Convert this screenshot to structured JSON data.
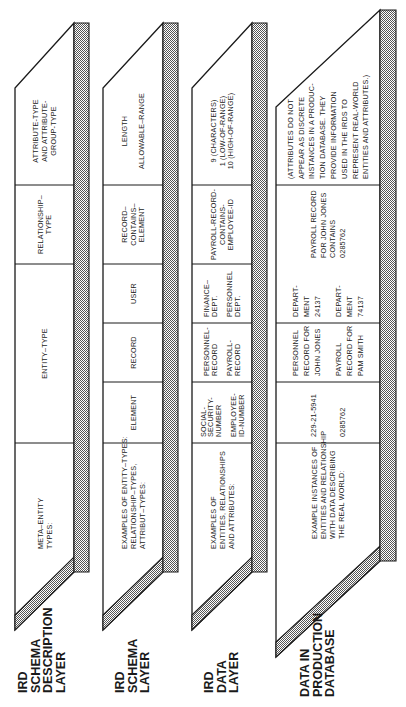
{
  "colors": {
    "ink": "#1a1a1a",
    "paper": "#ffffff",
    "shade": "#b9b9b9"
  },
  "layers": [
    {
      "name": [
        "IRD",
        "SCHEMA",
        "DESCRIPTION",
        "LAYER"
      ],
      "header": [
        "META–ENTITY",
        "TYPES:"
      ],
      "cells": [
        {
          "lines": [
            "ENTITY–TYPE"
          ]
        },
        {
          "lines": [
            "RELATIONSHIP–",
            "TYPE"
          ]
        },
        {
          "lines": [
            "ATTRIBUTE-TYPE",
            "AND ATTRIBUTE-",
            "GROUP-TYPE"
          ]
        }
      ]
    },
    {
      "name": [
        "IRD",
        "SCHEMA",
        "LAYER"
      ],
      "header": [
        "EXAMPLES OF ENTITY–TYPES:",
        "RELATIONSHIP–TYPES,",
        "ATTRIBUT–TYPES:"
      ],
      "cells": [
        {
          "lines": [
            "ELEMENT"
          ]
        },
        {
          "lines": [
            "RECORD"
          ]
        },
        {
          "lines": [
            "USER"
          ]
        },
        {
          "lines": [
            "RECORD–",
            "CONTAINS–",
            "ELEMENT"
          ]
        },
        {
          "lines": [
            "LENGTH",
            "",
            "ALLOWABLE–RANGE"
          ]
        }
      ]
    },
    {
      "name": [
        "IRD",
        "DATA",
        "LAYER"
      ],
      "header": [
        "EXAMPLES OF",
        "ENTITIES, RELATIONSHIPS",
        "AND ATTRIBUTES:"
      ],
      "cells": [
        {
          "lines": [
            "SOCIAL-",
            "SECURITY-",
            "NUMBER",
            "",
            "EMPLOYEE-",
            "ID-NUMBER"
          ]
        },
        {
          "lines": [
            "PERSONNEL-",
            "RECORD",
            "",
            "PAYROLL-",
            "RECORD"
          ]
        },
        {
          "lines": [
            "FINANCE–",
            "DEPT.",
            "",
            "PERSONNEL",
            "DEPT."
          ]
        },
        {
          "lines": [
            "PAYROLL-RECORD-",
            "CONTAINS-",
            "EMPLOYEE-ID"
          ]
        },
        {
          "lines": [
            "9 (CHARACTERS)",
            "1 (LOW-OF-RANGE)",
            "10 (HIGH-OF-RANGE)"
          ]
        }
      ]
    },
    {
      "name": [
        "DATA IN",
        "PRODUCTION",
        "DATABASE"
      ],
      "header": [
        "EXAMPLE INSTANCES OF",
        "ENTITIES AND RELATIONSHIP",
        "WITH DATA DESCRIBING",
        "THE REAL WORLD:"
      ],
      "cells": [
        {
          "lines": [
            "229-21-5941",
            "",
            "",
            "0285762"
          ]
        },
        {
          "lines": [
            "PERSONNEL",
            "RECORD FOR",
            "JOHN JONES",
            "",
            "PAYROLL",
            "RECORD FOR",
            "PAM SMITH"
          ]
        },
        {
          "lines": [
            "DEPART-",
            "MENT",
            "24137",
            "",
            "DEPART-",
            "MENT",
            "74137"
          ]
        },
        {
          "lines": [
            "PAYROLL RECORD",
            "FOR JOHN JONES",
            "CONTAINS",
            "0285762"
          ]
        },
        {
          "lines": [
            "(ATTRIBUTES DO NOT",
            "APPEAR AS DISCRETE",
            "INSTANCES IN A PRODUC-",
            "TION DATABASE. THEY",
            "PROVIDE INFORMATION",
            "USED IN THE IRDS TO",
            "REPRESENT REAL-WORLD",
            "ENTITIES AND ATTRIBUTES.)"
          ]
        }
      ]
    }
  ]
}
